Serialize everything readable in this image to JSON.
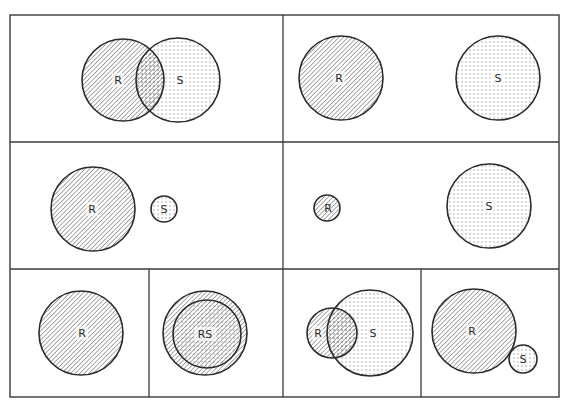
{
  "diagram": {
    "colors": {
      "line": "#2a2a2a",
      "background": "#ffffff",
      "hatch": "#555555",
      "dots": "#666666"
    },
    "legend_patterns": {
      "R": "diagonal-hatch",
      "S": "dot-stipple"
    },
    "panels": [
      {
        "id": 1,
        "relation": "overlap",
        "labels": [
          "R",
          "S"
        ],
        "circles": [
          {
            "name": "R",
            "cx": 123,
            "cy": 80,
            "r": 41,
            "fill": "hatch"
          },
          {
            "name": "S",
            "cx": 178,
            "cy": 80,
            "r": 42,
            "fill": "dots"
          }
        ]
      },
      {
        "id": 2,
        "relation": "disjoint-equal",
        "labels": [
          "R",
          "S"
        ],
        "circles": [
          {
            "name": "R",
            "cx": 341,
            "cy": 78,
            "r": 42,
            "fill": "hatch"
          },
          {
            "name": "S",
            "cx": 498,
            "cy": 78,
            "r": 42,
            "fill": "dots"
          }
        ]
      },
      {
        "id": 3,
        "relation": "disjoint-R-larger",
        "labels": [
          "R",
          "S"
        ],
        "circles": [
          {
            "name": "R",
            "cx": 93,
            "cy": 209,
            "r": 42,
            "fill": "hatch"
          },
          {
            "name": "S",
            "cx": 164,
            "cy": 209,
            "r": 13,
            "fill": "dots"
          }
        ]
      },
      {
        "id": 4,
        "relation": "disjoint-S-larger",
        "labels": [
          "R",
          "S"
        ],
        "circles": [
          {
            "name": "R",
            "cx": 327,
            "cy": 208,
            "r": 13,
            "fill": "hatch"
          },
          {
            "name": "S",
            "cx": 489,
            "cy": 206,
            "r": 42,
            "fill": "dots"
          }
        ]
      },
      {
        "id": 5,
        "relation": "single-R",
        "labels": [
          "R"
        ],
        "circles": [
          {
            "name": "R",
            "cx": 81,
            "cy": 333,
            "r": 42,
            "fill": "hatch"
          }
        ]
      },
      {
        "id": 6,
        "relation": "S-inside-R",
        "labels": [
          "RS"
        ],
        "circles": [
          {
            "name": "R",
            "cx": 205,
            "cy": 333,
            "r": 42,
            "fill": "hatch"
          },
          {
            "name": "S",
            "cx": 207,
            "cy": 334,
            "r": 34,
            "fill": "both"
          }
        ]
      },
      {
        "id": 7,
        "relation": "R-partly-inside-S",
        "labels": [
          "R",
          "S"
        ],
        "circles": [
          {
            "name": "R",
            "cx": 332,
            "cy": 333,
            "r": 25,
            "fill": "hatch"
          },
          {
            "name": "S",
            "cx": 370,
            "cy": 333,
            "r": 43,
            "fill": "dots"
          }
        ]
      },
      {
        "id": 8,
        "relation": "externally-tangent",
        "labels": [
          "R",
          "S"
        ],
        "circles": [
          {
            "name": "R",
            "cx": 474,
            "cy": 331,
            "r": 42,
            "fill": "hatch"
          },
          {
            "name": "S",
            "cx": 523,
            "cy": 359,
            "r": 14,
            "fill": "dots"
          }
        ]
      }
    ],
    "text": {
      "p1_R": "R",
      "p1_S": "S",
      "p2_R": "R",
      "p2_S": "S",
      "p3_R": "R",
      "p3_S": "S",
      "p4_R": "R",
      "p4_S": "S",
      "p5_R": "R",
      "p6_RS": "RS",
      "p7_R": "R",
      "p7_S": "S",
      "p8_R": "R",
      "p8_S": "S"
    }
  }
}
